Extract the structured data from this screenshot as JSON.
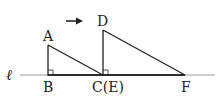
{
  "diagram": {
    "line_label": "ℓ",
    "points": {
      "A": "A",
      "B": "B",
      "C": "C(E)",
      "D": "D",
      "F": "F"
    },
    "arrow_direction": "right",
    "colors": {
      "stroke": "#222222",
      "line": "#999999"
    }
  }
}
